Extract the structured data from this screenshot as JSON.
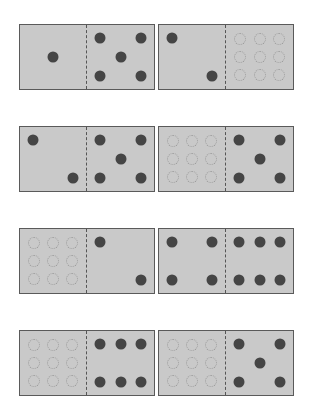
{
  "colors": {
    "tile": "#c9c9c9",
    "border": "#5a5a5a",
    "pip": "#454545",
    "empty_outline": "#9a9a9a"
  },
  "dominoes": [
    {
      "row": 1,
      "col": 1,
      "left": 1,
      "right": 5,
      "left_empty": false,
      "right_empty": false
    },
    {
      "row": 1,
      "col": 2,
      "left": 2,
      "right": 0,
      "left_empty": false,
      "right_empty": true
    },
    {
      "row": 2,
      "col": 1,
      "left": 2,
      "right": 5,
      "left_empty": false,
      "right_empty": false
    },
    {
      "row": 2,
      "col": 2,
      "left": 0,
      "right": 5,
      "left_empty": true,
      "right_empty": false
    },
    {
      "row": 3,
      "col": 1,
      "left": 0,
      "right": 2,
      "left_empty": true,
      "right_empty": false
    },
    {
      "row": 3,
      "col": 2,
      "left": 4,
      "right": 6,
      "left_empty": false,
      "right_empty": false
    },
    {
      "row": 4,
      "col": 1,
      "left": 0,
      "right": 6,
      "left_empty": true,
      "right_empty": false
    },
    {
      "row": 4,
      "col": 2,
      "left": 0,
      "right": 5,
      "left_empty": true,
      "right_empty": false
    }
  ]
}
